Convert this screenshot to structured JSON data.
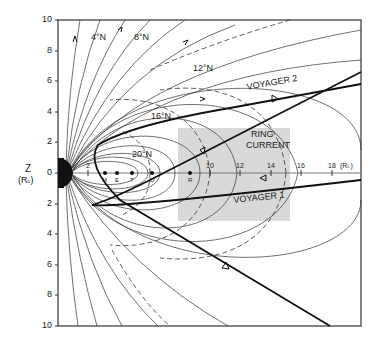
{
  "figure": {
    "y_axis": {
      "label": "Z",
      "unit": "(Rₛ)",
      "ticks_top": [
        "10",
        "8",
        "6",
        "4",
        "2",
        "0"
      ],
      "ticks_bottom": [
        "2",
        "4",
        "6",
        "8",
        "10"
      ]
    },
    "x_axis": {
      "ticks": [
        "2",
        "10",
        "12",
        "14",
        "16",
        "18"
      ],
      "unit": "(Rₛ)"
    },
    "moon_markers": [
      "M",
      "E",
      "T",
      "D",
      "R"
    ],
    "latitude_labels": [
      "4°N",
      "8°N",
      "12°N",
      "16°N",
      "20°N"
    ],
    "region_label_1": "RING",
    "region_label_2": "CURRENT",
    "trajectories": [
      "VOYAGER 2",
      "VOYAGER 1"
    ],
    "colors": {
      "ink": "#222222",
      "ring_current_fill": "#d9d9d9",
      "background": "#ffffff"
    }
  }
}
